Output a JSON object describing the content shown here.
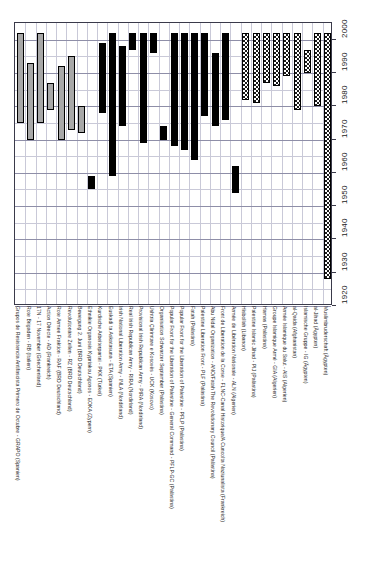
{
  "figure": {
    "kind": "gantt-timeline",
    "orientation": "category-axis-horizontal-time-axis-vertical",
    "background": "#ffffff"
  },
  "axis": {
    "time_ticks": [
      "2000",
      "1990",
      "1980",
      "1970",
      "1960",
      "1950",
      "1940",
      "1930",
      "1920"
    ],
    "time_min": 1920,
    "time_max": 2005,
    "grid": true
  },
  "legend_styles": {
    "gray": "#a8a8a8",
    "black": "#000000",
    "hatch": "#1b1b1b"
  },
  "chart_data": {
    "type": "bar",
    "title": "",
    "xlabel": "",
    "ylabel": "",
    "ylim": [
      1920,
      2005
    ],
    "tick_values": [
      2000,
      1990,
      1980,
      1970,
      1960,
      1950,
      1940,
      1930,
      1920
    ],
    "categories": [
      "Grupos de Resistencia Antifascista Primero de Octubre - GRAPO (Spanien)",
      "Rote Brigaden - RB (Italien)",
      "17N - 17 November (Griechenland)",
      "Action Directe - AD (Frankreich)",
      "Rote Armee Fraktion - RAF (BRD Deutschland)",
      "Revolutionäre Zellen - RZ (BRD Deutschland)",
      "Bewegung 2. Juni (BRD Deutschland)",
      "Ethnikie Organosis Kypriakou Agonos - EOKA (Zypern)",
      "Kurdische Arbeiterpartei - PKK (Türkei)",
      "Euskadi ta Askatasuna - ETA (Spanien)",
      "Irish National Liberation Army - INLA (Nordirland)",
      "Real Irish Republican Army - RIRA (Nordirland)",
      "Provisional Irish Republican Army - PIRA (Nordirland)",
      "Ushtria Çlirimtare e Kosovës - UCK (Kosovo)",
      "Organisation Schwarzer September (Palästina)",
      "Popular Front for the Liberation of Palestine - General Command - PFLP-GC (Palästina)",
      "Popular Front for the Liberation of Palestine - PFLP (Palästina)",
      "Fatah (Palästina)",
      "Palestine Liberation Front - PLF (Palästina)",
      "Abu Nidal Organization - ANO/Fatah The Revolutionary Council (Palästina)",
      "Front de Liberation de la Corse - FLNC-Canal Historique/A Cuncolta Naziunalista (Frankreich)",
      "Armée de Libération Nationale - ALN (Algerien)",
      "Hisbollah (Libanon)",
      "Palestine Islamic Jihad - PIJ (Palästina)",
      "Hamas (Palästina)",
      "Groupe Islamique Armé - GIA (Algerien)",
      "Armée Islamique du Salut - AIS (Algerien)",
      "al-Qaida (Afghanistan)",
      "Islamische Gruppe - IG (Ägypten)",
      "al-Jihad (Ägypten)",
      "Muslimbruderschaft (Ägypten)"
    ],
    "series": [
      {
        "name": "Grupos de Resistencia Antifascista Primero de Octubre - GRAPO (Spanien)",
        "start": 1975,
        "end": 2002,
        "style": "gray"
      },
      {
        "name": "Rote Brigaden - RB (Italien)",
        "start": 1970,
        "end": 1993,
        "style": "gray"
      },
      {
        "name": "17N - 17 November (Griechenland)",
        "start": 1975,
        "end": 2002,
        "style": "gray"
      },
      {
        "name": "Action Directe - AD (Frankreich)",
        "start": 1979,
        "end": 1987,
        "style": "gray"
      },
      {
        "name": "Rote Armee Fraktion - RAF (BRD Deutschland)",
        "start": 1970,
        "end": 1992,
        "style": "gray"
      },
      {
        "name": "Revolutionäre Zellen - RZ (BRD Deutschland)",
        "start": 1973,
        "end": 1995,
        "style": "gray"
      },
      {
        "name": "Bewegung 2. Juni (BRD Deutschland)",
        "start": 1972,
        "end": 1980,
        "style": "gray"
      },
      {
        "name": "Ethnikie Organosis Kypriakou Agonos - EOKA (Zypern)",
        "start": 1955,
        "end": 1959,
        "style": "black"
      },
      {
        "name": "Kurdische Arbeiterpartei - PKK (Türkei)",
        "start": 1978,
        "end": 1999,
        "style": "black"
      },
      {
        "name": "Euskadi ta Askatasuna - ETA (Spanien)",
        "start": 1959,
        "end": 2002,
        "style": "black"
      },
      {
        "name": "Irish National Liberation Army - INLA (Nordirland)",
        "start": 1974,
        "end": 1998,
        "style": "black"
      },
      {
        "name": "Real Irish Republican Army - RIRA (Nordirland)",
        "start": 1997,
        "end": 2002,
        "style": "black"
      },
      {
        "name": "Provisional Irish Republican Army - PIRA (Nordirland)",
        "start": 1969,
        "end": 2002,
        "style": "black"
      },
      {
        "name": "Ushtria Çlirimtare e Kosovës - UCK (Kosovo)",
        "start": 1996,
        "end": 2002,
        "style": "black"
      },
      {
        "name": "Organisation Schwarzer September (Palästina)",
        "start": 1970,
        "end": 1974,
        "style": "black"
      },
      {
        "name": "Popular Front for the Liberation of Palestine - General Command - PFLP-GC (Palästina)",
        "start": 1968,
        "end": 2002,
        "style": "black"
      },
      {
        "name": "Popular Front for the Liberation of Palestine - PFLP (Palästina)",
        "start": 1967,
        "end": 2002,
        "style": "black"
      },
      {
        "name": "Fatah (Palästina)",
        "start": 1964,
        "end": 2002,
        "style": "black"
      },
      {
        "name": "Palestine Liberation Front - PLF (Palästina)",
        "start": 1977,
        "end": 2002,
        "style": "black"
      },
      {
        "name": "Abu Nidal Organization - ANO/Fatah The Revolutionary Council (Palästina)",
        "start": 1974,
        "end": 1996,
        "style": "black"
      },
      {
        "name": "Front de Liberation de la Corse - FLNC-Canal Historique/A Cuncolta Naziunalista (Frankreich)",
        "start": 1976,
        "end": 2002,
        "style": "black"
      },
      {
        "name": "Armée de Libération Nationale - ALN (Algerien)",
        "start": 1954,
        "end": 1962,
        "style": "black"
      },
      {
        "name": "Hisbollah (Libanon)",
        "start": 1982,
        "end": 2002,
        "style": "hatch"
      },
      {
        "name": "Palestine Islamic Jihad - PIJ (Palästina)",
        "start": 1981,
        "end": 2002,
        "style": "hatch"
      },
      {
        "name": "Hamas (Palästina)",
        "start": 1987,
        "end": 2002,
        "style": "hatch"
      },
      {
        "name": "Groupe Islamique Armé - GIA (Algerien)",
        "start": 1986,
        "end": 2002,
        "style": "hatch"
      },
      {
        "name": "Armée Islamique du Salut - AIS (Algerien)",
        "start": 1989,
        "end": 2002,
        "style": "hatch"
      },
      {
        "name": "al-Qaida (Afghanistan)",
        "start": 1979,
        "end": 2002,
        "style": "hatch"
      },
      {
        "name": "Islamische Gruppe - IG (Ägypten)",
        "start": 1990,
        "end": 1997,
        "style": "hatch"
      },
      {
        "name": "al-Jihad (Ägypten)",
        "start": 1980,
        "end": 2002,
        "style": "hatch"
      },
      {
        "name": "Muslimbruderschaft (Ägypten)",
        "start": 1928,
        "end": 2002,
        "style": "hatch"
      }
    ]
  }
}
